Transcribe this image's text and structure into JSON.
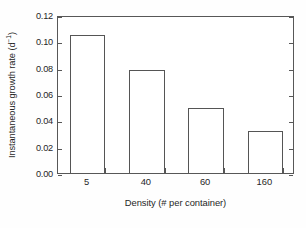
{
  "chart_data": {
    "type": "bar",
    "title": "",
    "subtitle": "",
    "categories": [
      "5",
      "40",
      "60",
      "160"
    ],
    "values": [
      0.105,
      0.078,
      0.049,
      0.032
    ],
    "xlabel": "Density (# per container)",
    "ylabel_text": "Instantaneous growth rate  (d",
    "ylabel_sup": "−1",
    "ylabel_tail": ")",
    "ylabel_full": "Instantaneous growth rate (d⁻¹)",
    "ylim": [
      0.0,
      0.12
    ],
    "yticks": [
      0.0,
      0.02,
      0.04,
      0.06,
      0.08,
      0.1,
      0.12
    ],
    "ytick_labels": [
      "0.00",
      "0.02",
      "0.04",
      "0.06",
      "0.08",
      "0.10",
      "0.12"
    ],
    "grid": false,
    "legend": false,
    "legend_position": "none",
    "bar_fill": "#ffffff",
    "bar_edge": "#555555",
    "axis_color": "#575757",
    "background": "#ffffff",
    "tick_direction": "in",
    "frame": "box"
  },
  "figure": {
    "axis_label_color": "#262626"
  }
}
